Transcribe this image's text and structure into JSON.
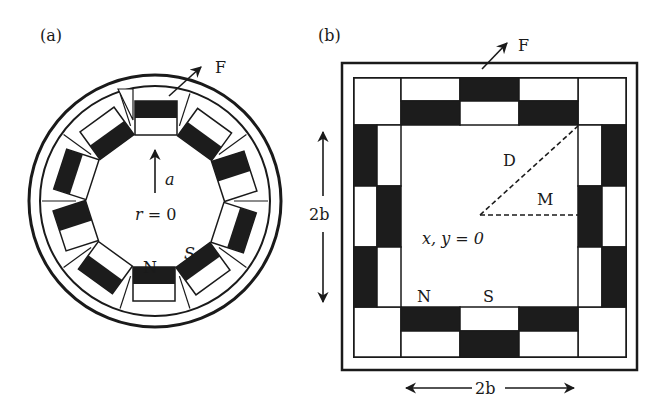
{
  "panel_a": {
    "label": "(a)",
    "force_label": "F",
    "radius_label": "a",
    "center_label": "r = 0",
    "north_label": "N",
    "south_label": "S",
    "segment_count": 10
  },
  "panel_b": {
    "label": "(b)",
    "force_label": "F",
    "diagonal_label": "D",
    "half_width_label": "M",
    "center_label": "x, y = 0",
    "north_label": "N",
    "south_label": "S",
    "height_label": "2b",
    "width_label": "2b"
  },
  "colors": {
    "ink": "#1a1a1a",
    "magnet_dark": "#1c1c1c",
    "background": "#ffffff"
  }
}
